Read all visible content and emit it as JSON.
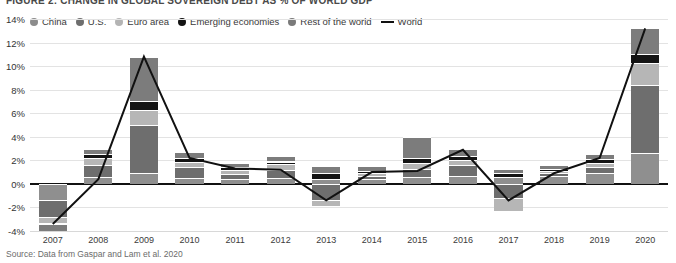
{
  "title": "FIGURE 2: CHANGE IN GLOBAL SOVEREIGN DEBT AS % OF WORLD GDP",
  "source": "Source: Data from Gaspar and Lam et al. 2020",
  "legend": {
    "items": [
      {
        "label": "China",
        "color": "#8c8c8c",
        "marker": "dot"
      },
      {
        "label": "U.S.",
        "color": "#6e6e6e",
        "marker": "dot"
      },
      {
        "label": "Euro area",
        "color": "#b4b4b4",
        "marker": "dot"
      },
      {
        "label": "Emerging economies",
        "color": "#141414",
        "marker": "dot"
      },
      {
        "label": "Rest of the world",
        "color": "#7a7a7a",
        "marker": "dot"
      },
      {
        "label": "World",
        "color": "#111111",
        "marker": "line"
      }
    ]
  },
  "chart_data": {
    "type": "bar",
    "stacked": true,
    "title": "FIGURE 2: CHANGE IN GLOBAL SOVEREIGN DEBT AS % OF WORLD GDP",
    "xlabel": "",
    "ylabel": "",
    "ylim": [
      -4,
      14
    ],
    "ytick_values": [
      14,
      12,
      10,
      8,
      6,
      4,
      2,
      0,
      -2,
      -4
    ],
    "ytick_labels": [
      "14%",
      "12%",
      "10%",
      "8%",
      "6%",
      "4%",
      "2%",
      "0%",
      "-2%",
      "-4%"
    ],
    "grid": true,
    "legend_position": "top-left",
    "categories": [
      "2007",
      "2008",
      "2009",
      "2010",
      "2011",
      "2012",
      "2013",
      "2014",
      "2015",
      "2016",
      "2017",
      "2018",
      "2019",
      "2020"
    ],
    "series": [
      {
        "name": "China",
        "color": "#8f8f8f",
        "values": [
          -1.4,
          0.6,
          0.9,
          0.5,
          0.4,
          0.5,
          0.4,
          0.4,
          0.6,
          0.7,
          0.6,
          0.7,
          0.9,
          2.6
        ]
      },
      {
        "name": "U.S.",
        "color": "#6e6e6e",
        "values": [
          -1.4,
          1.0,
          4.1,
          0.9,
          0.4,
          0.7,
          -1.4,
          0.3,
          0.7,
          0.9,
          -1.2,
          0.2,
          0.5,
          5.8
        ]
      },
      {
        "name": "Euro area",
        "color": "#b6b6b6",
        "values": [
          -0.5,
          0.6,
          1.3,
          0.5,
          0.4,
          0.5,
          -0.5,
          0.2,
          0.5,
          0.4,
          -1.1,
          0.2,
          0.4,
          1.9
        ]
      },
      {
        "name": "Emerging economies",
        "color": "#141414",
        "values": [
          -0.1,
          0.3,
          0.7,
          0.3,
          0.2,
          0.2,
          0.5,
          0.2,
          0.4,
          0.4,
          0.3,
          0.2,
          0.3,
          0.7
        ]
      },
      {
        "name": "Rest of the world",
        "color": "#7c7c7c",
        "values": [
          -0.6,
          0.5,
          3.8,
          0.5,
          0.4,
          0.5,
          0.6,
          0.4,
          1.8,
          0.6,
          0.4,
          0.3,
          0.4,
          2.2
        ]
      }
    ],
    "line_series": {
      "name": "World",
      "color": "#111111",
      "values": [
        -3.4,
        0.4,
        10.8,
        2.2,
        1.3,
        1.2,
        -1.4,
        1.0,
        1.1,
        2.9,
        -1.4,
        0.9,
        2.2,
        13.2
      ]
    }
  }
}
